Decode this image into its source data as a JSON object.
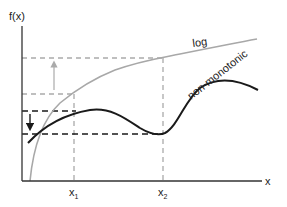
{
  "diagram": {
    "axes": {
      "y_label": "f(x)",
      "x_label": "x",
      "x_ticks": [
        {
          "base": "x",
          "sub": "1"
        },
        {
          "base": "x",
          "sub": "2"
        }
      ]
    },
    "curves": [
      {
        "name": "log",
        "label": "log",
        "color": "#a8a8a8"
      },
      {
        "name": "non-monotonic",
        "label": "non-monotonic",
        "color": "#1a1a1a"
      }
    ],
    "colors": {
      "axis": "#333333",
      "gray_guides": "#aaaaaa",
      "black_guides": "#1a1a1a"
    }
  }
}
